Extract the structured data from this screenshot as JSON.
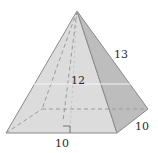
{
  "figure": {
    "type": "square-pyramid",
    "labels": {
      "slant_edge": "13",
      "height": "12",
      "base_front": "10",
      "base_side": "10"
    },
    "colors": {
      "front_face": "#dcdcdc",
      "right_face": "#bdbdbd",
      "edge": "#8a8a8a",
      "hidden_edge": "#9a9a9a"
    }
  }
}
